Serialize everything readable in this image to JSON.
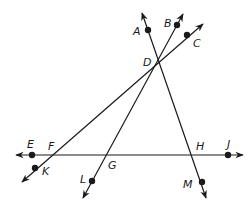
{
  "diagram": {
    "type": "intersecting-lines",
    "points": [
      {
        "id": "A",
        "label": "A",
        "x": 148,
        "y": 30,
        "dot": true,
        "lx": 133,
        "ly": 35
      },
      {
        "id": "B",
        "label": "B",
        "x": 177,
        "y": 25,
        "dot": true,
        "lx": 164,
        "ly": 27
      },
      {
        "id": "C",
        "label": "C",
        "x": 187,
        "y": 35,
        "dot": true,
        "lx": 193,
        "ly": 47
      },
      {
        "id": "D",
        "label": "D",
        "x": 158,
        "y": 59,
        "dot": false,
        "lx": 143,
        "ly": 66
      },
      {
        "id": "E",
        "label": "E",
        "x": 32,
        "y": 155,
        "dot": true,
        "lx": 27,
        "ly": 148
      },
      {
        "id": "F",
        "label": "F",
        "x": 50,
        "y": 155,
        "dot": false,
        "lx": 48,
        "ly": 150
      },
      {
        "id": "G",
        "label": "G",
        "x": 107,
        "y": 155,
        "dot": false,
        "lx": 108,
        "ly": 169
      },
      {
        "id": "H",
        "label": "H",
        "x": 191,
        "y": 155,
        "dot": false,
        "lx": 196,
        "ly": 150
      },
      {
        "id": "J",
        "label": "J",
        "x": 228,
        "y": 155,
        "dot": true,
        "lx": 227,
        "ly": 148
      },
      {
        "id": "K",
        "label": "K",
        "x": 35,
        "y": 168,
        "dot": true,
        "lx": 42,
        "ly": 175
      },
      {
        "id": "L",
        "label": "L",
        "x": 92,
        "y": 181,
        "dot": true,
        "lx": 80,
        "ly": 183
      },
      {
        "id": "M",
        "label": "M",
        "x": 202,
        "y": 182,
        "dot": true,
        "lx": 183,
        "ly": 188
      }
    ],
    "lines": [
      {
        "name": "line-AM",
        "x1": 142,
        "y1": 13,
        "x2": 206,
        "y2": 198,
        "arrows": "both"
      },
      {
        "name": "line-BL",
        "x1": 183,
        "y1": 14,
        "x2": 83,
        "y2": 198,
        "arrows": "both"
      },
      {
        "name": "line-CK",
        "x1": 203,
        "y1": 24,
        "x2": 22,
        "y2": 182,
        "arrows": "both"
      },
      {
        "name": "line-EJ",
        "x1": 16,
        "y1": 155,
        "x2": 243,
        "y2": 155,
        "arrows": "both"
      }
    ],
    "colors": {
      "stroke": "#1a1a1a",
      "background": "#ffffff"
    }
  }
}
